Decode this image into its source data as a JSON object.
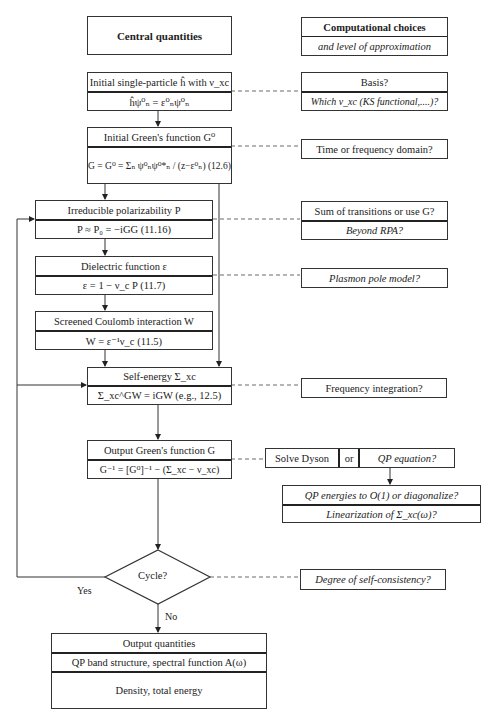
{
  "central": {
    "header": "Central quantities",
    "initial_h": {
      "title": "Initial single-particle ĥ with ν_xc",
      "eq": "ĥψ⁰ₙ = ε⁰ₙψ⁰ₙ"
    },
    "initial_g": {
      "title": "Initial Green's function G⁰",
      "eq": "G = G⁰ = Σₙ ψ⁰ₙψ⁰*ₙ / (z−ε⁰ₙ) (12.6)"
    },
    "polarizability": {
      "title": "Irreducible polarizability P",
      "eq": "P ≈ P₀ = −iGG (11.16)"
    },
    "dielectric": {
      "title": "Dielectric function ε",
      "eq": "ε = 1 − ν_c P (11.7)"
    },
    "screened": {
      "title": "Screened Coulomb interaction W",
      "eq": "W = ε⁻¹ν_c (11.5)"
    },
    "self_energy": {
      "title": "Self-energy Σ_xc",
      "eq": "Σ_xc^GW = iGW (e.g., 12.5)"
    },
    "output_g": {
      "title": "Output Green's function G",
      "eq": "G⁻¹ = [G⁰]⁻¹ − (Σ_xc − ν_xc)"
    },
    "cycle": {
      "label": "Cycle?",
      "yes": "Yes",
      "no": "No"
    },
    "output": {
      "title": "Output quantities",
      "row1": "QP band structure, spectral function A(ω)",
      "row2": "Density, total energy"
    }
  },
  "choices": {
    "header": "Computational choices",
    "subheader": "and level of approximation",
    "basis": {
      "title": "Basis?",
      "sub": "Which v_xc (KS functional,....)?"
    },
    "time_freq": "Time or frequency domain?",
    "transitions": {
      "title": "Sum of transitions or use G?",
      "sub": "Beyond RPA?"
    },
    "plasmon": "Plasmon pole model?",
    "freq_int": "Frequency integration?",
    "dyson": {
      "left": "Solve Dyson",
      "mid": "or",
      "right": "QP equation?"
    },
    "qp": {
      "title": "QP energies to O(1) or diagonalize?",
      "sub": "Linearization of Σ_xc(ω)?"
    },
    "self_consistency": "Degree of self-consistency?"
  }
}
